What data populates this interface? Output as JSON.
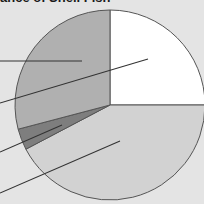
{
  "chart_data": {
    "type": "pie",
    "start_angle_deg": 90,
    "direction": "clockwise",
    "slices": [
      {
        "label": "",
        "value": 25.0,
        "color": "#ffffff"
      },
      {
        "label": "",
        "value": 42.3,
        "color": "#d2d2d2"
      },
      {
        "label": "",
        "value": 3.6,
        "color": "#7e7e7e"
      },
      {
        "label": "",
        "value": 29.1,
        "color": "#b0b0b0"
      }
    ],
    "legend": "none (leader lines extend off left edge; labels cropped)",
    "leader_lines": 4
  },
  "colors": {
    "background": "#e4e4e4",
    "outline": "#555555",
    "leader": "#333333"
  },
  "title_text": "ance of Shell Fish"
}
